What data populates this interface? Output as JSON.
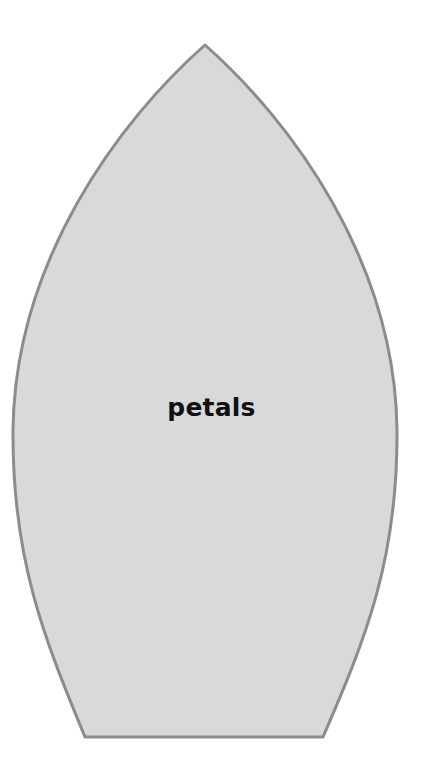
{
  "diagram": {
    "shape": "petal-template",
    "label": "petals",
    "colors": {
      "fill": "#d9d9d9",
      "stroke": "#8c8c8c",
      "text": "#111111",
      "background": "#ffffff"
    }
  }
}
